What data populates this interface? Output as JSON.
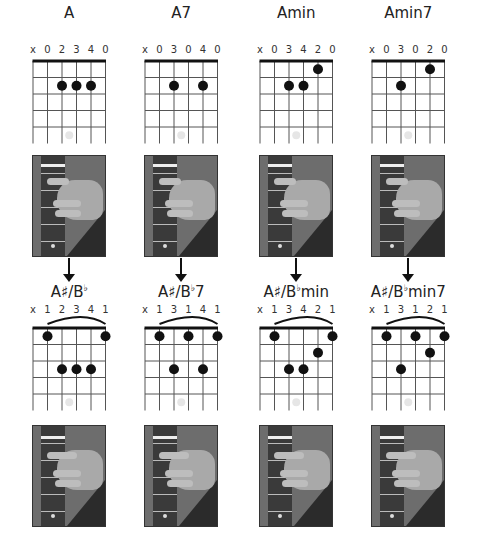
{
  "top_row": [
    {
      "name": "A",
      "fingering": [
        "x",
        "0",
        "2",
        "3",
        "4",
        "0"
      ],
      "barre": false,
      "dots": [
        {
          "string": 3,
          "fret": 2
        },
        {
          "string": 4,
          "fret": 2
        },
        {
          "string": 5,
          "fret": 2
        }
      ]
    },
    {
      "name": "A7",
      "fingering": [
        "x",
        "0",
        "3",
        "0",
        "4",
        "0"
      ],
      "barre": false,
      "dots": [
        {
          "string": 3,
          "fret": 2
        },
        {
          "string": 5,
          "fret": 2
        }
      ]
    },
    {
      "name": "Amin",
      "fingering": [
        "x",
        "0",
        "3",
        "4",
        "2",
        "0"
      ],
      "barre": false,
      "dots": [
        {
          "string": 5,
          "fret": 1
        },
        {
          "string": 3,
          "fret": 2
        },
        {
          "string": 4,
          "fret": 2
        }
      ]
    },
    {
      "name": "Amin7",
      "fingering": [
        "x",
        "0",
        "3",
        "0",
        "2",
        "0"
      ],
      "barre": false,
      "dots": [
        {
          "string": 5,
          "fret": 1
        },
        {
          "string": 3,
          "fret": 2
        }
      ]
    }
  ],
  "bottom_row": [
    {
      "name_root": "A♯/B",
      "name_flat": "♭",
      "name_suffix": "",
      "fingering": [
        "x",
        "1",
        "2",
        "3",
        "4",
        "1"
      ],
      "barre": true,
      "dots": [
        {
          "string": 2,
          "fret": 1
        },
        {
          "string": 6,
          "fret": 1
        },
        {
          "string": 3,
          "fret": 3
        },
        {
          "string": 4,
          "fret": 3
        },
        {
          "string": 5,
          "fret": 3
        }
      ]
    },
    {
      "name_root": "A♯/B",
      "name_flat": "♭",
      "name_suffix": "7",
      "fingering": [
        "x",
        "1",
        "3",
        "1",
        "4",
        "1"
      ],
      "barre": true,
      "dots": [
        {
          "string": 2,
          "fret": 1
        },
        {
          "string": 4,
          "fret": 1
        },
        {
          "string": 6,
          "fret": 1
        },
        {
          "string": 3,
          "fret": 3
        },
        {
          "string": 5,
          "fret": 3
        }
      ]
    },
    {
      "name_root": "A♯/B",
      "name_flat": "♭",
      "name_suffix": "min",
      "fingering": [
        "x",
        "1",
        "3",
        "4",
        "2",
        "1"
      ],
      "barre": true,
      "dots": [
        {
          "string": 2,
          "fret": 1
        },
        {
          "string": 6,
          "fret": 1
        },
        {
          "string": 5,
          "fret": 2
        },
        {
          "string": 3,
          "fret": 3
        },
        {
          "string": 4,
          "fret": 3
        }
      ]
    },
    {
      "name_root": "A♯/B",
      "name_flat": "♭",
      "name_suffix": "min7",
      "fingering": [
        "x",
        "1",
        "3",
        "1",
        "2",
        "1"
      ],
      "barre": true,
      "dots": [
        {
          "string": 2,
          "fret": 1
        },
        {
          "string": 4,
          "fret": 1
        },
        {
          "string": 6,
          "fret": 1
        },
        {
          "string": 5,
          "fret": 2
        },
        {
          "string": 3,
          "fret": 3
        }
      ]
    }
  ],
  "colors": {
    "dot": "#111111",
    "grid": "#555555",
    "marker": "#e6e6e6"
  }
}
